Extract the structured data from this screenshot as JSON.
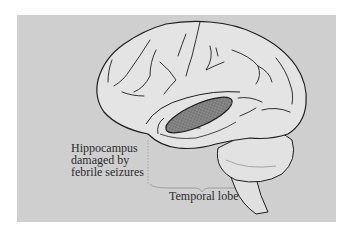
{
  "figure": {
    "colors": {
      "background": "#cfcfcf",
      "brain_fill": "#e4e4e4",
      "outline": "#1e1e1e",
      "hippocampus_fill": "#8a8a8a",
      "guide_lines": "#9a9a9a"
    },
    "labels": {
      "hippocampus": {
        "line1": "Hippocampus",
        "line2": "damaged by",
        "line3": "febrile seizures"
      },
      "temporal_lobe": "Temporal lobe"
    }
  }
}
